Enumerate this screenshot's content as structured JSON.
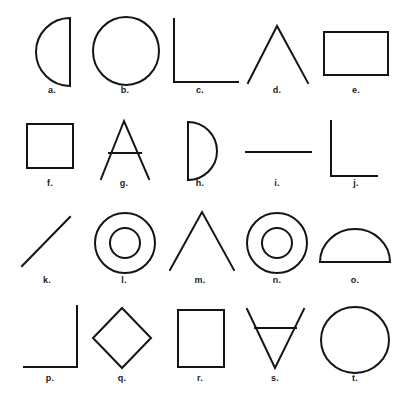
{
  "sheet": {
    "title": "Geometric shape identification sheet",
    "background_color": "#ffffff",
    "ink_color": "#141414",
    "width": 412,
    "height": 399,
    "stroke_width": 2,
    "columns": 5,
    "rows": 4,
    "total_figures": 20
  },
  "figures": [
    {
      "label": "a.",
      "shape": "semicircle-flat-right",
      "description": "Half disc bulging to the left with a straight vertical edge on the right",
      "row": 1,
      "column": 1,
      "label_x": 52,
      "label_y": 90
    },
    {
      "label": "b.",
      "shape": "circle",
      "description": "Plain circle outline",
      "row": 1,
      "column": 2,
      "label_x": 125,
      "label_y": 90
    },
    {
      "label": "c.",
      "shape": "right-angle-corner-lower-left",
      "description": "Two line segments forming a right angle, vertical on the left and horizontal along the bottom",
      "row": 1,
      "column": 3,
      "label_x": 200,
      "label_y": 90
    },
    {
      "label": "d.",
      "shape": "inverted-vee",
      "description": "Two lines meeting at a peak, like the letter lambda",
      "row": 1,
      "column": 4,
      "label_x": 277,
      "label_y": 90
    },
    {
      "label": "e.",
      "shape": "rectangle-landscape",
      "description": "Wide rectangle outline",
      "row": 1,
      "column": 5,
      "label_x": 356,
      "label_y": 90
    },
    {
      "label": "f.",
      "shape": "square",
      "description": "Square outline",
      "row": 2,
      "column": 1,
      "label_x": 50,
      "label_y": 183
    },
    {
      "label": "g.",
      "shape": "letter-a",
      "description": "Capital letter A with a crossbar",
      "row": 2,
      "column": 2,
      "label_x": 124,
      "label_y": 183
    },
    {
      "label": "h.",
      "shape": "semicircle-flat-left",
      "description": "Half disc bulging to the right with a straight vertical edge on the left, like a letter D",
      "row": 2,
      "column": 3,
      "label_x": 200,
      "label_y": 183
    },
    {
      "label": "i.",
      "shape": "horizontal-line",
      "description": "Single horizontal line segment",
      "row": 2,
      "column": 4,
      "label_x": 277,
      "label_y": 183
    },
    {
      "label": "j.",
      "shape": "right-angle-corner-lower-left",
      "description": "Right angle with a vertical line on the left and a horizontal line along the bottom",
      "row": 2,
      "column": 5,
      "label_x": 356,
      "label_y": 183
    },
    {
      "label": "k.",
      "shape": "diagonal-line",
      "description": "Single diagonal line rising from lower left to upper right",
      "row": 3,
      "column": 1,
      "label_x": 47,
      "label_y": 280
    },
    {
      "label": "l.",
      "shape": "concentric-circles",
      "description": "Small circle centered inside a larger circle",
      "row": 3,
      "column": 2,
      "label_x": 124,
      "label_y": 280
    },
    {
      "label": "m.",
      "shape": "inverted-vee",
      "description": "Two lines meeting at a peak, like the letter lambda",
      "row": 3,
      "column": 3,
      "label_x": 200,
      "label_y": 280
    },
    {
      "label": "n.",
      "shape": "concentric-circles",
      "description": "Small circle centered inside a larger circle",
      "row": 3,
      "column": 4,
      "label_x": 277,
      "label_y": 280
    },
    {
      "label": "o.",
      "shape": "semicircle-flat-bottom",
      "description": "Half disc with the dome upward and a straight edge along the bottom",
      "row": 3,
      "column": 5,
      "label_x": 355,
      "label_y": 280
    },
    {
      "label": "p.",
      "shape": "right-angle-corner-lower-right",
      "description": "Right angle with a vertical line on the right and a horizontal line along the bottom",
      "row": 4,
      "column": 1,
      "label_x": 50,
      "label_y": 378
    },
    {
      "label": "q.",
      "shape": "diamond",
      "description": "Square rotated forty five degrees",
      "row": 4,
      "column": 2,
      "label_x": 122,
      "label_y": 378
    },
    {
      "label": "r.",
      "shape": "rectangle-portrait",
      "description": "Tall rectangle outline",
      "row": 4,
      "column": 3,
      "label_x": 200,
      "label_y": 378
    },
    {
      "label": "s.",
      "shape": "inverted-letter-a",
      "description": "Upside down capital A, a V shape with a crossbar near the top",
      "row": 4,
      "column": 4,
      "label_x": 275,
      "label_y": 378
    },
    {
      "label": "t.",
      "shape": "circle",
      "description": "Plain circle outline",
      "row": 4,
      "column": 5,
      "label_x": 355,
      "label_y": 378
    }
  ]
}
